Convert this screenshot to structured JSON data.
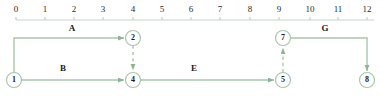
{
  "diagram": {
    "type": "activity-on-arrow-network-timeline",
    "line_color": "#a9c5ad",
    "axis_color": "#c2cfc3",
    "text_color": "#1a1a1a",
    "axis": {
      "name": "time-axis",
      "min": 0,
      "max": 12,
      "ticks": [
        {
          "value": "0",
          "x": 16
        },
        {
          "value": "1",
          "x": 45
        },
        {
          "value": "2",
          "x": 74
        },
        {
          "value": "3",
          "x": 103
        },
        {
          "value": "4",
          "x": 133
        },
        {
          "value": "5",
          "x": 162
        },
        {
          "value": "6",
          "x": 191
        },
        {
          "value": "7",
          "x": 220
        },
        {
          "value": "8",
          "x": 250
        },
        {
          "value": "9",
          "x": 279
        },
        {
          "value": "10",
          "x": 310
        },
        {
          "value": "11",
          "x": 338
        },
        {
          "value": "12",
          "x": 367
        }
      ],
      "label_y": 4,
      "line_y": 20
    },
    "nodes": [
      {
        "id": "1",
        "label": "1",
        "x": 14,
        "y": 80,
        "r": 7.5
      },
      {
        "id": "2",
        "label": "2",
        "x": 133,
        "y": 38,
        "r": 7.5
      },
      {
        "id": "4",
        "label": "4",
        "x": 133,
        "y": 80,
        "r": 7.5
      },
      {
        "id": "5",
        "label": "5",
        "x": 283,
        "y": 80,
        "r": 7.5
      },
      {
        "id": "7",
        "label": "7",
        "x": 283,
        "y": 38,
        "r": 7.5
      },
      {
        "id": "8",
        "label": "8",
        "x": 367,
        "y": 80,
        "r": 7.5
      }
    ],
    "edges": [
      {
        "id": "A",
        "label": "A",
        "from": "1",
        "to": "2",
        "style": "solid",
        "label_x": 72,
        "label_y": 32
      },
      {
        "id": "B",
        "label": "B",
        "from": "1",
        "to": "4",
        "style": "solid",
        "label_x": 63,
        "label_y": 72
      },
      {
        "id": "E",
        "label": "E",
        "from": "4",
        "to": "5",
        "style": "solid",
        "label_x": 194,
        "label_y": 72
      },
      {
        "id": "G",
        "label": "G",
        "from": "7",
        "to": "8",
        "style": "solid",
        "label_x": 325,
        "label_y": 32
      },
      {
        "id": "dummy-2-4",
        "label": "",
        "from": "2",
        "to": "4",
        "style": "dashed",
        "label_x": 0,
        "label_y": 0
      },
      {
        "id": "dummy-5-7",
        "label": "",
        "from": "5",
        "to": "7",
        "style": "dashed",
        "label_x": 0,
        "label_y": 0
      }
    ]
  }
}
